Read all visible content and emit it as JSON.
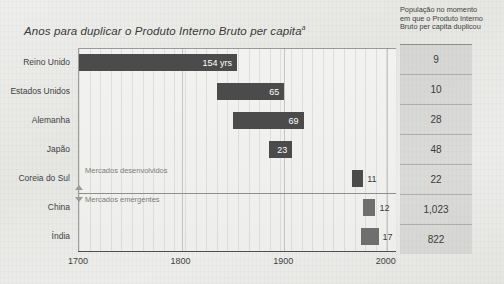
{
  "chart_data": {
    "type": "bar",
    "title": "Anos para duplicar o Produto Interno Bruto per capita",
    "title_footnote_marker": "a",
    "orientation": "horizontal-timeline",
    "xlabel": "",
    "ylabel": "",
    "xlim": [
      1700,
      2010
    ],
    "xticks": [
      1700,
      1800,
      1900,
      2000
    ],
    "xtick_labels": [
      "1700",
      "1800",
      "1900",
      "2000"
    ],
    "grid": true,
    "grid_minor_step_years": 10,
    "legend": false,
    "value_unit_label": "yrs",
    "categories": [
      "Reino Unido",
      "Estados Unidos",
      "Alemanha",
      "Japão",
      "Coreia do Sul",
      "China",
      "Índia"
    ],
    "values": [
      154,
      65,
      69,
      23,
      11,
      12,
      17
    ],
    "value_labels": [
      "154 yrs",
      "65",
      "69",
      "23",
      "11",
      "12",
      "17"
    ],
    "bars": [
      {
        "category": "Reino Unido",
        "value": 154,
        "label": "154 yrs",
        "start_year": 1700,
        "end_year": 1854,
        "group": "Mercados desenvolvidos",
        "color": "#4b4b4b",
        "label_inside": true,
        "population": "9"
      },
      {
        "category": "Estados Unidos",
        "value": 65,
        "label": "65",
        "start_year": 1835,
        "end_year": 1900,
        "group": "Mercados desenvolvidos",
        "color": "#4b4b4b",
        "label_inside": true,
        "population": "10"
      },
      {
        "category": "Alemanha",
        "value": 69,
        "label": "69",
        "start_year": 1850,
        "end_year": 1919,
        "group": "Mercados desenvolvidos",
        "color": "#4b4b4b",
        "label_inside": true,
        "population": "28"
      },
      {
        "category": "Japão",
        "value": 23,
        "label": "23",
        "start_year": 1885,
        "end_year": 1908,
        "group": "Mercados desenvolvidos",
        "color": "#4b4b4b",
        "label_inside": true,
        "population": "48"
      },
      {
        "category": "Coreia do Sul",
        "value": 11,
        "label": "11",
        "start_year": 1966,
        "end_year": 1977,
        "group": "Mercados desenvolvidos",
        "color": "#4b4b4b",
        "label_inside": false,
        "population": "22"
      },
      {
        "category": "China",
        "value": 12,
        "label": "12",
        "start_year": 1977,
        "end_year": 1989,
        "group": "Mercados emergentes",
        "color": "#6f6f6f",
        "label_inside": false,
        "population": "1,023"
      },
      {
        "category": "Índia",
        "value": 17,
        "label": "17",
        "start_year": 1975,
        "end_year": 1992,
        "group": "Mercados emergentes",
        "color": "#6f6f6f",
        "label_inside": false,
        "population": "822"
      }
    ],
    "group_annotations": [
      {
        "label": "Mercados desenvolvidos",
        "after_category_index": 4
      },
      {
        "label": "Mercados emergentes",
        "after_category_index": 5
      }
    ],
    "side_table": {
      "header": "População no momento em que o Produto Interno Bruto per capita duplicou",
      "values": [
        "9",
        "10",
        "28",
        "48",
        "22",
        "1,023",
        "822"
      ]
    },
    "colors": {
      "bar_developed": "#4b4b4b",
      "bar_emerging": "#6f6f6f",
      "background": "#e9e9e7",
      "plot_background": "#f0f0ee",
      "axis": "#4f4f4f",
      "text": "#3d3d3d",
      "side_panel": "#b0b0ae"
    }
  }
}
